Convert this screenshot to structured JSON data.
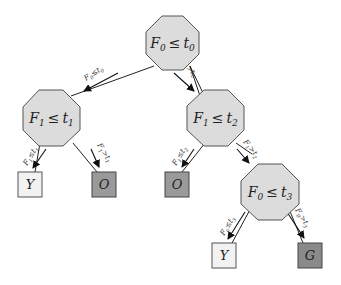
{
  "diagram": {
    "type": "decision-tree",
    "colors": {
      "internal_fill": "#dcdcdc",
      "internal_stroke": "#555555",
      "leaf_light": "#f2f2f2",
      "leaf_mid": "#9a9a9a",
      "leaf_dark": "#8a8a8a",
      "edge": "#222222"
    },
    "nodes": {
      "root": {
        "feature": "F",
        "feature_sub": "0",
        "op": "≤",
        "threshold": "t",
        "threshold_sub": "0"
      },
      "left": {
        "feature": "F",
        "feature_sub": "1",
        "op": "≤",
        "threshold": "t",
        "threshold_sub": "1"
      },
      "right": {
        "feature": "F",
        "feature_sub": "1",
        "op": "≤",
        "threshold": "t",
        "threshold_sub": "2"
      },
      "right_right": {
        "feature": "F",
        "feature_sub": "0",
        "op": "≤",
        "threshold": "t",
        "threshold_sub": "3"
      }
    },
    "leaves": {
      "left_left": {
        "label": "Y"
      },
      "left_right": {
        "label": "O"
      },
      "right_left": {
        "label": "O"
      },
      "right_right_left": {
        "label": "Y"
      },
      "right_right_right": {
        "label": "G"
      }
    },
    "edges": {
      "root_left": {
        "f": "F",
        "fs": "0",
        "op": "≤",
        "t": "t",
        "ts": "0"
      },
      "root_right": {
        "f": "F",
        "fs": "0",
        "op": ">",
        "t": "t",
        "ts": "0"
      },
      "left_left": {
        "f": "F",
        "fs": "1",
        "op": "≤",
        "t": "t",
        "ts": "1"
      },
      "left_right": {
        "f": "F",
        "fs": "1",
        "op": ">",
        "t": "t",
        "ts": "1"
      },
      "right_left": {
        "f": "F",
        "fs": "1",
        "op": "≤",
        "t": "t",
        "ts": "2"
      },
      "right_right": {
        "f": "F",
        "fs": "1",
        "op": ">",
        "t": "t",
        "ts": "2"
      },
      "rr_left": {
        "f": "F",
        "fs": "0",
        "op": "≤",
        "t": "t",
        "ts": "3"
      },
      "rr_right": {
        "f": "F",
        "fs": "0",
        "op": ">",
        "t": "t",
        "ts": "3"
      }
    }
  }
}
